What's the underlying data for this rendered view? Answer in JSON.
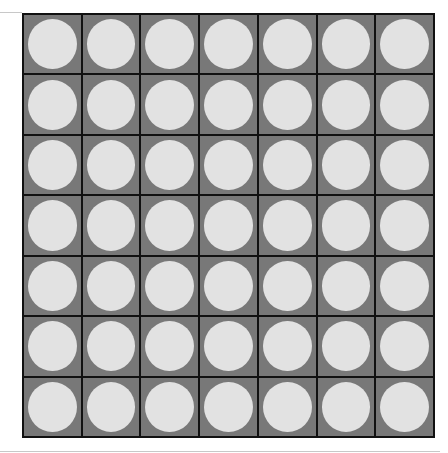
{
  "board": {
    "rows": 7,
    "cols": 7,
    "cell_color": "#787878",
    "disc_color": "#e2e2e2",
    "grid_line_color": "#111111",
    "cells": [
      [
        "empty",
        "empty",
        "empty",
        "empty",
        "empty",
        "empty",
        "empty"
      ],
      [
        "empty",
        "empty",
        "empty",
        "empty",
        "empty",
        "empty",
        "empty"
      ],
      [
        "empty",
        "empty",
        "empty",
        "empty",
        "empty",
        "empty",
        "empty"
      ],
      [
        "empty",
        "empty",
        "empty",
        "empty",
        "empty",
        "empty",
        "empty"
      ],
      [
        "empty",
        "empty",
        "empty",
        "empty",
        "empty",
        "empty",
        "empty"
      ],
      [
        "empty",
        "empty",
        "empty",
        "empty",
        "empty",
        "empty",
        "empty"
      ],
      [
        "empty",
        "empty",
        "empty",
        "empty",
        "empty",
        "empty",
        "empty"
      ]
    ]
  }
}
